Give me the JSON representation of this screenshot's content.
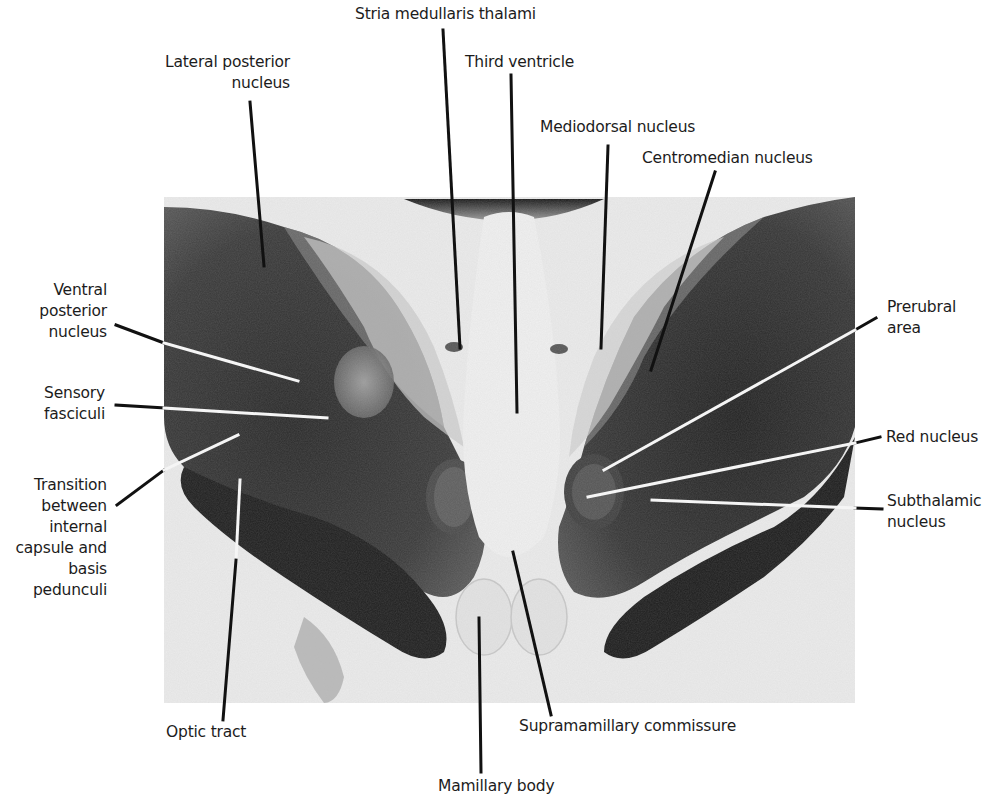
{
  "figure": {
    "type": "labeled histological brain section (coronal, diencephalon level)",
    "background": "#ffffff",
    "photo": {
      "tone": "grayscale",
      "stain_dark": "#1e1e1e",
      "tissue_light": "#e6e6e6"
    },
    "labels": [
      {
        "id": "stria-medullaris-thalami",
        "text": "Stria medullaris thalami"
      },
      {
        "id": "lateral-posterior-nucleus",
        "text": "Lateral posterior\nnucleus"
      },
      {
        "id": "third-ventricle",
        "text": "Third ventricle"
      },
      {
        "id": "mediodorsal-nucleus",
        "text": "Mediodorsal nucleus"
      },
      {
        "id": "centromedian-nucleus",
        "text": "Centromedian nucleus"
      },
      {
        "id": "ventral-posterior-nucleus",
        "text": "Ventral\nposterior\nnucleus"
      },
      {
        "id": "sensory-fasciculi",
        "text": "Sensory\nfasciculi"
      },
      {
        "id": "prerubral-area",
        "text": "Prerubral\narea"
      },
      {
        "id": "red-nucleus",
        "text": "Red nucleus"
      },
      {
        "id": "subthalamic-nucleus",
        "text": "Subthalamic\nnucleus"
      },
      {
        "id": "transition-internal-capsule",
        "text": "Transition\nbetween\ninternal\ncapsule and\nbasis\npedunculi"
      },
      {
        "id": "optic-tract",
        "text": "Optic tract"
      },
      {
        "id": "supramamillary-commissure",
        "text": "Supramamillary commissure"
      },
      {
        "id": "mamillary-body",
        "text": "Mamillary body"
      }
    ]
  }
}
